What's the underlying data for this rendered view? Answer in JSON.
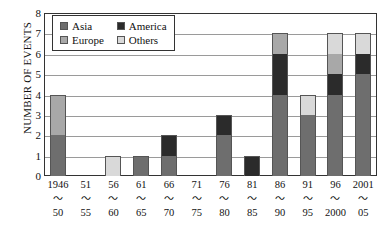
{
  "chart_data": {
    "type": "bar",
    "stacked": true,
    "title": "",
    "xlabel": "",
    "ylabel": "NUMBER OF EVENTS",
    "ylim": [
      0,
      8
    ],
    "ytick_labels": [
      "8",
      "7",
      "6",
      "5",
      "4",
      "3",
      "2",
      "1",
      "0"
    ],
    "grid": true,
    "legend_position": "top-left-inside",
    "categories": [
      "1946〜50",
      "51〜55",
      "56〜60",
      "61〜65",
      "66〜70",
      "71〜75",
      "76〜80",
      "81〜85",
      "86〜90",
      "91〜95",
      "96〜2000",
      "2001〜05"
    ],
    "category_lines": [
      {
        "start": "1946",
        "sep": "〜",
        "end": "50"
      },
      {
        "start": "51",
        "sep": "〜",
        "end": "55"
      },
      {
        "start": "56",
        "sep": "〜",
        "end": "60"
      },
      {
        "start": "61",
        "sep": "〜",
        "end": "65"
      },
      {
        "start": "66",
        "sep": "〜",
        "end": "70"
      },
      {
        "start": "71",
        "sep": "〜",
        "end": "75"
      },
      {
        "start": "76",
        "sep": "〜",
        "end": "80"
      },
      {
        "start": "81",
        "sep": "〜",
        "end": "85"
      },
      {
        "start": "86",
        "sep": "〜",
        "end": "90"
      },
      {
        "start": "91",
        "sep": "〜",
        "end": "95"
      },
      {
        "start": "96",
        "sep": "〜",
        "end": "2000"
      },
      {
        "start": "2001",
        "sep": "〜",
        "end": "05"
      }
    ],
    "series": [
      {
        "name": "Asia",
        "color": "#6e6e6e",
        "values": [
          2,
          0,
          0,
          1,
          1,
          0,
          2,
          0,
          4,
          3,
          4,
          5
        ]
      },
      {
        "name": "America",
        "color": "#2b2b2b",
        "values": [
          0,
          0,
          0,
          0,
          1,
          0,
          1,
          1,
          2,
          0,
          1,
          1
        ]
      },
      {
        "name": "Europe",
        "color": "#a8a8a8",
        "values": [
          2,
          0,
          0,
          0,
          0,
          0,
          0,
          0,
          1,
          0,
          1,
          0
        ]
      },
      {
        "name": "Others",
        "color": "#d9d9d9",
        "values": [
          0,
          0,
          1,
          0,
          0,
          0,
          0,
          0,
          0,
          1,
          1,
          1
        ]
      }
    ],
    "totals": [
      4,
      0,
      1,
      1,
      2,
      0,
      3,
      1,
      7,
      4,
      7,
      7
    ],
    "stack_order": [
      "Asia",
      "America",
      "Europe",
      "Others"
    ]
  },
  "legend": {
    "entries": [
      {
        "label": "Asia",
        "color": "#6e6e6e"
      },
      {
        "label": "America",
        "color": "#2b2b2b"
      },
      {
        "label": "Europe",
        "color": "#a8a8a8"
      },
      {
        "label": "Others",
        "color": "#d9d9d9"
      }
    ]
  },
  "axis": {
    "y_title": "NUMBER OF EVENTS"
  }
}
